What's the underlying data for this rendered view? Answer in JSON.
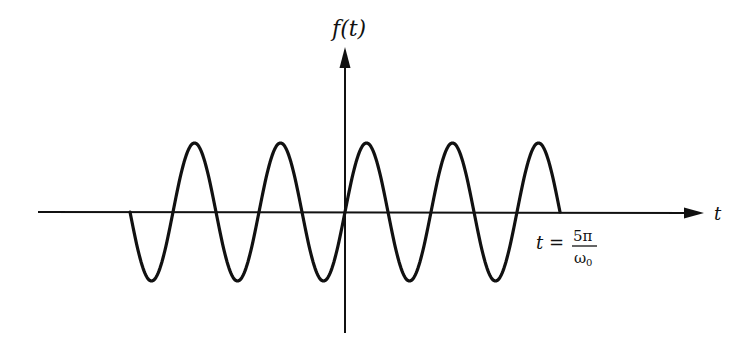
{
  "figure": {
    "y_axis_label": "f(t)",
    "x_axis_label": "t",
    "end_annotation": {
      "lhs": "t",
      "equals": "=",
      "numerator": "5π",
      "denominator": "ω",
      "denominator_subscript": "0"
    }
  },
  "colors": {
    "stroke": "#111111",
    "background": "#ffffff"
  },
  "chart_data": {
    "type": "line",
    "title": "",
    "xlabel": "t",
    "ylabel": "f(t)",
    "function": "f(t) = sin(ω0 t) for -5π/ω0 ≤ t ≤ 5π/ω0, else 0",
    "x_range_units_of_pi_over_omega0": [
      -5,
      5
    ],
    "periods_shown": 5,
    "amplitude": 1,
    "annotations": [
      "t = 5π/ω0"
    ],
    "grid": false,
    "legend": "none",
    "layout_px": {
      "origin": [
        345,
        212
      ],
      "period_px": 86,
      "amplitude_px": 69,
      "x_axis": [
        38,
        704
      ],
      "y_axis": [
        48,
        333
      ]
    }
  }
}
